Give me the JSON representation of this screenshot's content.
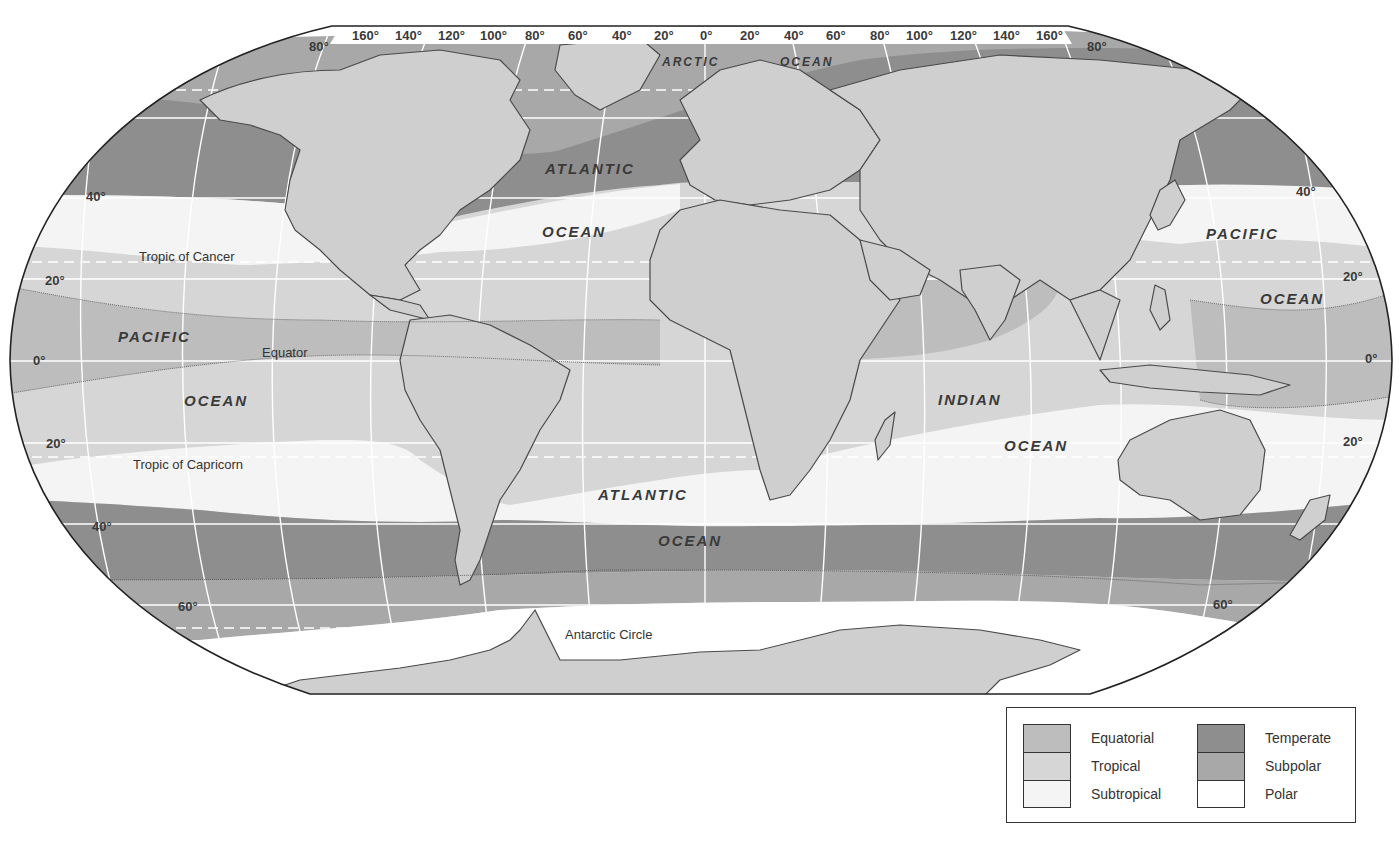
{
  "map": {
    "projection": "robinson",
    "ocean_labels": [
      {
        "id": "arctic-ocean-1",
        "text": "ARCTIC",
        "x": 662,
        "y": 66,
        "size": 12
      },
      {
        "id": "arctic-ocean-2",
        "text": "OCEAN",
        "x": 780,
        "y": 66,
        "size": 12
      },
      {
        "id": "north-atlantic-1",
        "text": "ATLANTIC",
        "x": 545,
        "y": 174,
        "size": 15
      },
      {
        "id": "north-atlantic-2",
        "text": "OCEAN",
        "x": 542,
        "y": 237,
        "size": 15
      },
      {
        "id": "north-pacific-west-1",
        "text": "PACIFIC",
        "x": 118,
        "y": 342,
        "size": 15
      },
      {
        "id": "north-pacific-west-2",
        "text": "OCEAN",
        "x": 184,
        "y": 406,
        "size": 15
      },
      {
        "id": "north-pacific-east-1",
        "text": "PACIFIC",
        "x": 1206,
        "y": 239,
        "size": 15
      },
      {
        "id": "north-pacific-east-2",
        "text": "OCEAN",
        "x": 1260,
        "y": 304,
        "size": 15
      },
      {
        "id": "indian-ocean-1",
        "text": "INDIAN",
        "x": 938,
        "y": 405,
        "size": 15
      },
      {
        "id": "indian-ocean-2",
        "text": "OCEAN",
        "x": 1004,
        "y": 451,
        "size": 15
      },
      {
        "id": "south-atlantic-1",
        "text": "ATLANTIC",
        "x": 598,
        "y": 500,
        "size": 15
      },
      {
        "id": "south-atlantic-2",
        "text": "OCEAN",
        "x": 658,
        "y": 546,
        "size": 15
      }
    ],
    "line_labels": [
      {
        "id": "tropic-of-cancer",
        "text": "Tropic of Cancer",
        "x": 139,
        "y": 261
      },
      {
        "id": "equator",
        "text": "Equator",
        "x": 262,
        "y": 357
      },
      {
        "id": "tropic-of-capricorn",
        "text": "Tropic of Capricorn",
        "x": 133,
        "y": 469
      },
      {
        "id": "antarctic-circle",
        "text": "Antarctic Circle",
        "x": 565,
        "y": 639
      }
    ],
    "top_longitudes": [
      "160°",
      "140°",
      "120°",
      "100°",
      "80°",
      "60°",
      "40°",
      "20°",
      "0°",
      "20°",
      "40°",
      "60°",
      "80°",
      "100°",
      "120°",
      "140°",
      "160°"
    ],
    "latitude_labels": [
      {
        "text": "80°",
        "x": 309,
        "y": 51
      },
      {
        "text": "80°",
        "x": 1087,
        "y": 51
      },
      {
        "text": "40°",
        "x": 86,
        "y": 201
      },
      {
        "text": "40°",
        "x": 1296,
        "y": 196
      },
      {
        "text": "20°",
        "x": 45,
        "y": 285
      },
      {
        "text": "20°",
        "x": 1343,
        "y": 281
      },
      {
        "text": "0°",
        "x": 33,
        "y": 365
      },
      {
        "text": "0°",
        "x": 1365,
        "y": 363
      },
      {
        "text": "20°",
        "x": 46,
        "y": 448
      },
      {
        "text": "20°",
        "x": 1343,
        "y": 446
      },
      {
        "text": "40°",
        "x": 92,
        "y": 531
      },
      {
        "text": "60°",
        "x": 178,
        "y": 611
      },
      {
        "text": "60°",
        "x": 1213,
        "y": 609
      }
    ]
  },
  "legend": {
    "left": [
      {
        "label": "Equatorial",
        "color": "#bdbdbd"
      },
      {
        "label": "Tropical",
        "color": "#d6d6d6"
      },
      {
        "label": "Subtropical",
        "color": "#f4f4f4"
      }
    ],
    "right": [
      {
        "label": "Temperate",
        "color": "#8e8e8e"
      },
      {
        "label": "Subpolar",
        "color": "#a8a8a8"
      },
      {
        "label": "Polar",
        "color": "#ffffff"
      }
    ]
  },
  "colors": {
    "land": "#cfcfcf",
    "land_border": "#4a4a4a",
    "equatorial": "#bdbdbd",
    "tropical": "#d6d6d6",
    "subtropical": "#f4f4f4",
    "temperate": "#8e8e8e",
    "subpolar": "#a8a8a8",
    "polar": "#ffffff",
    "graticule": "#ffffff"
  }
}
